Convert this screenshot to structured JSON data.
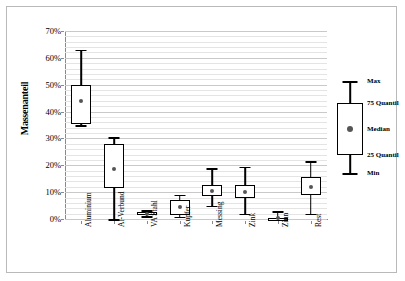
{
  "chart_data": {
    "type": "box",
    "title": "",
    "xlabel": "",
    "ylabel": "Massenanteil",
    "ylim": [
      0,
      70
    ],
    "y_unit": "%",
    "grid": true,
    "y_ticks": [
      "0%",
      "10%",
      "20%",
      "30%",
      "40%",
      "50%",
      "60%",
      "70%"
    ],
    "y_tick_values": [
      0,
      10,
      20,
      30,
      40,
      50,
      60,
      70
    ],
    "minor_grid_step": 2,
    "categories": [
      "Aluminium",
      "Al-Verbund",
      "VA Stahl",
      "Kupfer",
      "Messing",
      "Zink",
      "Zinn",
      "Rest"
    ],
    "series_name": "Massenanteil",
    "boxes": [
      {
        "category": "Aluminium",
        "min": 35.0,
        "q25": 35.5,
        "median": 44.0,
        "q75": 50.0,
        "max": 63.0
      },
      {
        "category": "Al-Verbund",
        "min": 0.0,
        "q25": 11.5,
        "median": 18.5,
        "q75": 28.0,
        "max": 30.5
      },
      {
        "category": "VA Stahl",
        "min": 1.0,
        "q25": 1.6,
        "median": 2.0,
        "q75": 2.6,
        "max": 3.2
      },
      {
        "category": "Kupfer",
        "min": 0.8,
        "q25": 1.5,
        "median": 4.5,
        "q75": 7.2,
        "max": 9.0
      },
      {
        "category": "Messing",
        "min": 5.0,
        "q25": 8.5,
        "median": 10.5,
        "q75": 12.5,
        "max": 19.0
      },
      {
        "category": "Zink",
        "min": 2.0,
        "q25": 8.0,
        "median": 10.0,
        "q75": 12.5,
        "max": 19.5
      },
      {
        "category": "Zinn",
        "min": 0.0,
        "q25": 0.0,
        "median": 0.3,
        "q75": 0.5,
        "max": 3.0
      },
      {
        "category": "Rest",
        "min": 2.0,
        "q25": 9.0,
        "median": 12.0,
        "q75": 15.5,
        "max": 21.5
      }
    ],
    "legend": {
      "position": "right-outside",
      "entries": [
        {
          "key": "max",
          "label": "Max"
        },
        {
          "key": "q75",
          "label": "75 Quantil"
        },
        {
          "key": "med",
          "label": "Median"
        },
        {
          "key": "q25",
          "label": "25 Quantil"
        },
        {
          "key": "min",
          "label": "Min"
        }
      ]
    },
    "colors": {
      "line": "#000000",
      "box_fill": "#ffffff",
      "median_marker": "#555555",
      "grid": "#d8d8d8",
      "axis": "#8a8a8a",
      "frame": "#b9b9b9"
    }
  }
}
